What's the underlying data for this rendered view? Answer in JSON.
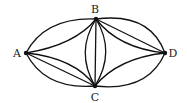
{
  "diagram": {
    "type": "multigraph",
    "vertices": [
      {
        "id": "A",
        "label": "A",
        "x": 26,
        "y": 53,
        "lx": 17,
        "ly": 57
      },
      {
        "id": "B",
        "label": "B",
        "x": 96,
        "y": 19,
        "lx": 95,
        "ly": 13
      },
      {
        "id": "C",
        "label": "C",
        "x": 95,
        "y": 86,
        "lx": 95,
        "ly": 101
      },
      {
        "id": "D",
        "label": "D",
        "x": 165,
        "y": 53,
        "lx": 173,
        "ly": 57
      }
    ],
    "edges": [
      {
        "from": "A",
        "to": "B",
        "count": 2
      },
      {
        "from": "A",
        "to": "C",
        "count": 3
      },
      {
        "from": "B",
        "to": "C",
        "count": 3
      },
      {
        "from": "B",
        "to": "D",
        "count": 3
      },
      {
        "from": "C",
        "to": "D",
        "count": 2
      }
    ],
    "colors": {
      "stroke": "#111111",
      "background": "#ffffff"
    }
  }
}
